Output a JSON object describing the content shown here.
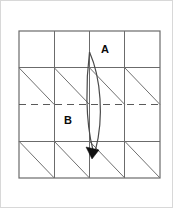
{
  "figure": {
    "type": "fold-diagram",
    "background_color": "#ffffff",
    "frame": {
      "border_color": "#d8d8d8",
      "x": 0,
      "y": 0,
      "width": 173,
      "height": 208
    },
    "grid": {
      "columns": 4,
      "rows": 4,
      "left": 19,
      "top": 31,
      "right": 160,
      "bottom": 178,
      "line_color": "#6b6b6b",
      "x_positions": [
        19,
        54.25,
        89.5,
        124.75,
        160
      ],
      "y_positions": [
        31,
        67.75,
        104.5,
        141.25,
        178
      ]
    },
    "diagonals": {
      "color": "#707070",
      "direction": "top-left-to-bottom-right",
      "rows_with_diagonals": [
        2,
        4
      ],
      "cells_per_row": 4
    },
    "fold_line": {
      "style": "dashed",
      "orientation": "horizontal",
      "color": "#5a5a5a",
      "y": 104.5,
      "x_start": 19,
      "x_end": 160,
      "dash_pattern": "7 5"
    },
    "fold_arrow": {
      "color": "#4a4a4a",
      "shape": "lens-arc",
      "start_x": 89.5,
      "start_y": 52,
      "end_x": 93,
      "end_y": 152,
      "arrowhead_color": "#111111",
      "arrowhead_x": 93,
      "arrowhead_y": 152,
      "direction": "downward"
    },
    "labels": [
      {
        "id": "label-a",
        "text": "A",
        "x": 105,
        "y": 50
      },
      {
        "id": "label-b",
        "text": "B",
        "x": 68,
        "y": 121
      }
    ]
  }
}
